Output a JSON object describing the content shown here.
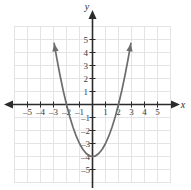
{
  "figure": {
    "name": "coordinate-plane-parabola",
    "background_color": "#ffffff",
    "grid_color": "#e2e2e5",
    "axis_color": "#2b2b2b",
    "curve_color": "#6d6d6d"
  },
  "axes": {
    "x_axis_label": "x",
    "y_axis_label": "y",
    "x_ticks": [
      {
        "value": -5,
        "label": "–5"
      },
      {
        "value": -4,
        "label": "–4"
      },
      {
        "value": -3,
        "label": "–3"
      },
      {
        "value": -2,
        "label": "–2"
      },
      {
        "value": -1,
        "label": "–1"
      },
      {
        "value": 1,
        "label": "1"
      },
      {
        "value": 2,
        "label": "2"
      },
      {
        "value": 3,
        "label": "3"
      },
      {
        "value": 4,
        "label": "4"
      },
      {
        "value": 5,
        "label": "5"
      }
    ],
    "y_ticks": [
      {
        "value": 5,
        "label": "5"
      },
      {
        "value": 4,
        "label": "4"
      },
      {
        "value": 3,
        "label": "3"
      },
      {
        "value": 2,
        "label": "2"
      },
      {
        "value": 1,
        "label": "1"
      },
      {
        "value": -1,
        "label": "–1"
      },
      {
        "value": -2,
        "label": "–2"
      },
      {
        "value": -3,
        "label": "–3"
      },
      {
        "value": -4,
        "label": "–4"
      },
      {
        "value": -5,
        "label": "–5"
      }
    ]
  },
  "chart_data": {
    "type": "line",
    "title": "",
    "xlabel": "x",
    "ylabel": "y",
    "xlim": [
      -6,
      6
    ],
    "ylim": [
      -6,
      6
    ],
    "grid": true,
    "legend": "none",
    "series": [
      {
        "name": "parabola",
        "equation": "y = x^2 - 4",
        "vertex": [
          0,
          -4
        ],
        "x_intercepts": [
          -2,
          2
        ],
        "y_intercept": -4,
        "opens": "up",
        "arrowheads": [
          "start",
          "end"
        ],
        "x": [
          -2.95,
          -2.75,
          -2.5,
          -2.25,
          -2.0,
          -1.75,
          -1.5,
          -1.25,
          -1.0,
          -0.75,
          -0.5,
          -0.25,
          0,
          0.25,
          0.5,
          0.75,
          1.0,
          1.25,
          1.5,
          1.75,
          2.0,
          2.25,
          2.5,
          2.75,
          2.95
        ],
        "y": [
          4.7,
          3.56,
          2.25,
          1.06,
          0,
          -0.94,
          -1.75,
          -2.44,
          -3.0,
          -3.44,
          -3.75,
          -3.94,
          -4.0,
          -3.94,
          -3.75,
          -3.44,
          -3.0,
          -2.44,
          -1.75,
          -0.94,
          0,
          1.06,
          2.25,
          3.56,
          4.7
        ]
      }
    ]
  }
}
